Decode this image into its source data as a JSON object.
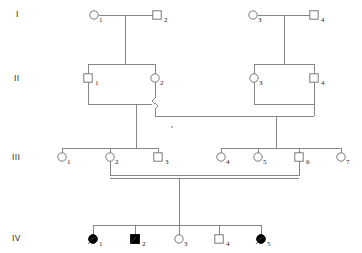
{
  "figure": {
    "type": "pedigree-chart",
    "width": 362,
    "height": 253,
    "background_color": "#ffffff",
    "line_color": "#7a7a7a",
    "filled_color": "#000000",
    "open_fill_color": "#ffffff"
  },
  "generation_labels": [
    {
      "id": "gen-I",
      "text": "I",
      "x": 16,
      "y": 17
    },
    {
      "id": "gen-II",
      "text": "II",
      "x": 14,
      "y": 81
    },
    {
      "id": "gen-III",
      "text": "III",
      "x": 12,
      "y": 160
    },
    {
      "id": "gen-IV",
      "text": "IV",
      "x": 12,
      "y": 241
    }
  ],
  "legend_meaning": {
    "circle": "female",
    "square": "male",
    "filled": "affected",
    "open": "unaffected",
    "double_line": "consanguineous-mating"
  },
  "individuals": [
    {
      "key": "I-1",
      "generation": "I",
      "number": "1",
      "sex": "female",
      "shape": "circle",
      "affected": false,
      "cx": 94,
      "cy": 15,
      "r": 4.2,
      "label_x": 99,
      "label_y": 22
    },
    {
      "key": "I-2",
      "generation": "I",
      "number": "2",
      "sex": "male",
      "shape": "square",
      "affected": false,
      "cx": 157,
      "cy": 15,
      "r": 4.2,
      "label_x": 164,
      "label_y": 22
    },
    {
      "key": "I-3",
      "generation": "I",
      "number": "3",
      "sex": "female",
      "shape": "circle",
      "affected": false,
      "cx": 253,
      "cy": 15,
      "r": 4.2,
      "label_x": 258,
      "label_y": 22
    },
    {
      "key": "I-4",
      "generation": "I",
      "number": "4",
      "sex": "male",
      "shape": "square",
      "affected": false,
      "cx": 314,
      "cy": 15,
      "r": 4.2,
      "label_x": 321,
      "label_y": 22
    },
    {
      "key": "II-1",
      "generation": "II",
      "number": "1",
      "sex": "male",
      "shape": "square",
      "affected": false,
      "cx": 88,
      "cy": 78,
      "r": 4.2,
      "label_x": 95,
      "label_y": 85
    },
    {
      "key": "II-2",
      "generation": "II",
      "number": "2",
      "sex": "female",
      "shape": "circle",
      "affected": false,
      "cx": 155,
      "cy": 78,
      "r": 4.2,
      "label_x": 160,
      "label_y": 85
    },
    {
      "key": "II-3",
      "generation": "II",
      "number": "3",
      "sex": "female",
      "shape": "circle",
      "affected": false,
      "cx": 254,
      "cy": 78,
      "r": 4.2,
      "label_x": 259,
      "label_y": 85
    },
    {
      "key": "II-4",
      "generation": "II",
      "number": "4",
      "sex": "male",
      "shape": "square",
      "affected": false,
      "cx": 314,
      "cy": 78,
      "r": 4.2,
      "label_x": 321,
      "label_y": 85
    },
    {
      "key": "III-1",
      "generation": "III",
      "number": "1",
      "sex": "female",
      "shape": "circle",
      "affected": false,
      "cx": 62,
      "cy": 157,
      "r": 4.2,
      "label_x": 67,
      "label_y": 164
    },
    {
      "key": "III-2",
      "generation": "III",
      "number": "2",
      "sex": "female",
      "shape": "circle",
      "affected": false,
      "cx": 110,
      "cy": 157,
      "r": 4.2,
      "label_x": 115,
      "label_y": 164
    },
    {
      "key": "III-3",
      "generation": "III",
      "number": "3",
      "sex": "male",
      "shape": "square",
      "affected": false,
      "cx": 158,
      "cy": 157,
      "r": 4.2,
      "label_x": 165,
      "label_y": 164
    },
    {
      "key": "III-4",
      "generation": "III",
      "number": "4",
      "sex": "female",
      "shape": "circle",
      "affected": false,
      "cx": 221,
      "cy": 157,
      "r": 4.2,
      "label_x": 226,
      "label_y": 164
    },
    {
      "key": "III-5",
      "generation": "III",
      "number": "5",
      "sex": "female",
      "shape": "circle",
      "affected": false,
      "cx": 258,
      "cy": 157,
      "r": 4.2,
      "label_x": 263,
      "label_y": 164
    },
    {
      "key": "III-6",
      "generation": "III",
      "number": "6",
      "sex": "male",
      "shape": "square",
      "affected": false,
      "cx": 299,
      "cy": 157,
      "r": 4.2,
      "label_x": 306,
      "label_y": 164
    },
    {
      "key": "III-7",
      "generation": "III",
      "number": "7",
      "sex": "female",
      "shape": "circle",
      "affected": false,
      "cx": 341,
      "cy": 157,
      "r": 4.2,
      "label_x": 346,
      "label_y": 164
    },
    {
      "key": "IV-1",
      "generation": "IV",
      "number": "1",
      "sex": "female",
      "shape": "circle",
      "affected": true,
      "cx": 93,
      "cy": 239,
      "r": 4.4,
      "label_x": 99,
      "label_y": 246
    },
    {
      "key": "IV-2",
      "generation": "IV",
      "number": "2",
      "sex": "male",
      "shape": "square",
      "affected": true,
      "cx": 135,
      "cy": 239,
      "r": 4.4,
      "label_x": 142,
      "label_y": 246
    },
    {
      "key": "IV-3",
      "generation": "IV",
      "number": "3",
      "sex": "female",
      "shape": "circle",
      "affected": false,
      "cx": 179,
      "cy": 239,
      "r": 4.2,
      "label_x": 184,
      "label_y": 246
    },
    {
      "key": "IV-4",
      "generation": "IV",
      "number": "4",
      "sex": "male",
      "shape": "square",
      "affected": false,
      "cx": 219,
      "cy": 239,
      "r": 4.2,
      "label_x": 226,
      "label_y": 246
    },
    {
      "key": "IV-5",
      "generation": "IV",
      "number": "5",
      "sex": "female",
      "shape": "circle",
      "affected": true,
      "cx": 261,
      "cy": 239,
      "r": 4.4,
      "label_x": 267,
      "label_y": 246
    }
  ],
  "connector_paths": [
    {
      "name": "mating-I1-I2",
      "d": "M 98.5 15 L 152.5 15"
    },
    {
      "name": "descent-I1xI2",
      "d": "M 125 15 L 125 64"
    },
    {
      "name": "sibship-II1-II2",
      "d": "M 88 64 L 155 64"
    },
    {
      "name": "drop-II1",
      "d": "M 88 64 L 88 73.8"
    },
    {
      "name": "drop-II2",
      "d": "M 155 64 L 155 73.8"
    },
    {
      "name": "mating-I3-I4",
      "d": "M 257.5 15 L 309.5 15"
    },
    {
      "name": "descent-I3xI4",
      "d": "M 284 15 L 284 64"
    },
    {
      "name": "sibship-II3-II4",
      "d": "M 254 64 L 314 64"
    },
    {
      "name": "drop-II3",
      "d": "M 254 64 L 254 73.8"
    },
    {
      "name": "drop-II4",
      "d": "M 314 64 L 314 73.8"
    },
    {
      "name": "mating-II1-II2-left",
      "d": "M 88 82.2 L 88 104 L 152 104"
    },
    {
      "name": "mating-II1-II2-hop",
      "d": "M 155 82.2 L 155 98 L 152 101 L 158 106 L 155 109 L 155 116"
    },
    {
      "name": "descent-II1xII2",
      "d": "M 136 104 L 136 148"
    },
    {
      "name": "mating-II2-II4-bar",
      "d": "M 155 116 L 314 116"
    },
    {
      "name": "mating-II3-drop",
      "d": "M 254 82.2 L 254 104"
    },
    {
      "name": "mating-II3-II4-bar",
      "d": "M 254 104 L 314 104"
    },
    {
      "name": "drop-II4-down",
      "d": "M 314 82.2 L 314 116"
    },
    {
      "name": "descent-II2xII4",
      "d": "M 276 116 L 276 148"
    },
    {
      "name": "sibship-III-left",
      "d": "M 62 148 L 158 148"
    },
    {
      "name": "drop-III1",
      "d": "M 62 148 L 62 152.8"
    },
    {
      "name": "drop-III2",
      "d": "M 110 148 L 110 152.8"
    },
    {
      "name": "drop-III3",
      "d": "M 158 148 L 158 152.8"
    },
    {
      "name": "sibship-III-right",
      "d": "M 221 148 L 341 148"
    },
    {
      "name": "drop-III4",
      "d": "M 221 148 L 221 152.8"
    },
    {
      "name": "drop-III5",
      "d": "M 258 148 L 258 152.8"
    },
    {
      "name": "drop-III6",
      "d": "M 299 148 L 299 152.8"
    },
    {
      "name": "drop-III7",
      "d": "M 341 148 L 341 152.8"
    },
    {
      "name": "drop-III2-to-union",
      "d": "M 110 161.2 L 110 176"
    },
    {
      "name": "drop-III6-to-union",
      "d": "M 299 161.2 L 299 176"
    },
    {
      "name": "consang-line-upper",
      "d": "M 110 175 L 299 175"
    },
    {
      "name": "consang-line-lower",
      "d": "M 110 178 L 299 178"
    },
    {
      "name": "descent-III2xIII6",
      "d": "M 179 178 L 179 225"
    },
    {
      "name": "sibship-IV",
      "d": "M 93 225 L 261 225"
    },
    {
      "name": "drop-IV1",
      "d": "M 93 225 L 93 234.6"
    },
    {
      "name": "drop-IV2",
      "d": "M 135 225 L 135 234.6"
    },
    {
      "name": "drop-IV3",
      "d": "M 179 225 L 179 234.8"
    },
    {
      "name": "drop-IV4",
      "d": "M 219 225 L 219 234.8"
    },
    {
      "name": "drop-IV5",
      "d": "M 261 225 L 261 234.6"
    }
  ],
  "affected_slashes": [
    {
      "name": "slash-IV-1",
      "d": "M 88 244 L 94 237"
    },
    {
      "name": "slash-IV-2",
      "d": "M 130 244 L 136 237"
    },
    {
      "name": "slash-IV-5",
      "d": "M 256 244 L 262 237"
    }
  ],
  "marks": [
    {
      "name": "stray-dot",
      "x": 172,
      "y": 127,
      "r": 0.8
    }
  ]
}
